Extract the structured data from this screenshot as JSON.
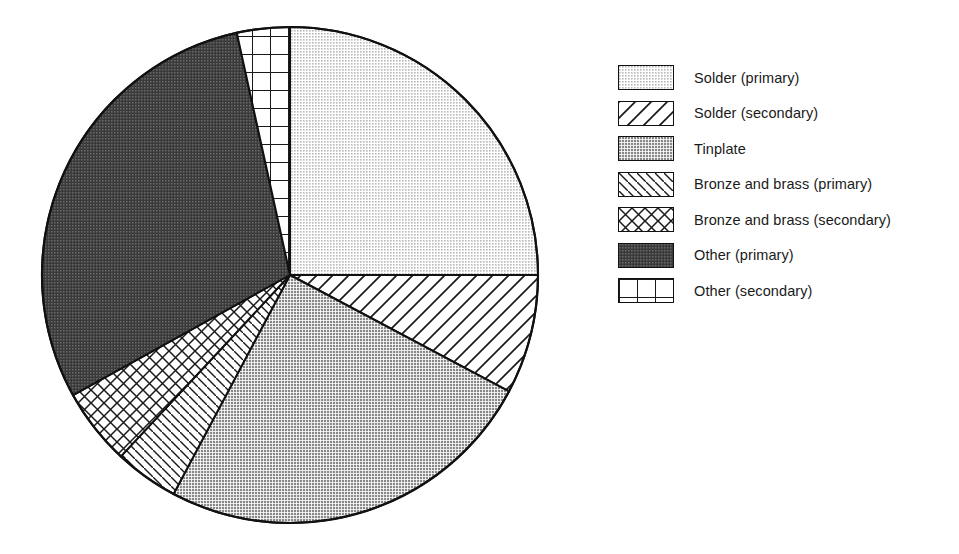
{
  "chart_data": {
    "type": "pie",
    "title": "",
    "subtitle": "",
    "xlabel": "",
    "ylabel": "",
    "legend_position": "right",
    "grid": false,
    "start_angle_deg": 0,
    "direction": "clockwise",
    "categories": [
      "Solder (primary)",
      "Solder (secondary)",
      "Tinplate",
      "Bronze and brass (primary)",
      "Bronze and brass (secondary)",
      "Other (primary)",
      "Other (secondary)"
    ],
    "values": [
      25.0,
      7.8,
      25.0,
      4.2,
      5.0,
      29.7,
      3.3
    ],
    "units": "percent",
    "slices": [
      {
        "label": "Solder (primary)",
        "value": 25.0,
        "start_deg": 0,
        "end_deg": 90,
        "pattern": "fine-stipple-light",
        "fill": "#d9d9d9"
      },
      {
        "label": "Solder (secondary)",
        "value": 7.8,
        "start_deg": 90,
        "end_deg": 118,
        "pattern": "diagonal-hatch-backslash-wide",
        "fill": "#ffffff"
      },
      {
        "label": "Tinplate",
        "value": 25.0,
        "start_deg": 118,
        "end_deg": 208,
        "pattern": "stipple-medium",
        "fill": "#a8a8a8"
      },
      {
        "label": "Bronze and brass (primary)",
        "value": 4.2,
        "start_deg": 208,
        "end_deg": 223,
        "pattern": "diagonal-hatch-slash-narrow",
        "fill": "#ffffff"
      },
      {
        "label": "Bronze and brass (secondary)",
        "value": 5.0,
        "start_deg": 223,
        "end_deg": 241,
        "pattern": "cross-hatch-diagonal",
        "fill": "#ffffff"
      },
      {
        "label": "Other (primary)",
        "value": 29.7,
        "start_deg": 241,
        "end_deg": 347.6,
        "pattern": "stipple-dark",
        "fill": "#4d4d4d"
      },
      {
        "label": "Other (secondary)",
        "value": 3.3,
        "start_deg": 347.6,
        "end_deg": 360,
        "pattern": "grid-square",
        "fill": "#ffffff"
      }
    ],
    "geometry": {
      "center_x": 290,
      "center_y": 275,
      "radius": 248
    }
  },
  "legend": {
    "items": [
      {
        "label": "Solder (primary)",
        "pattern": "fine-stipple-light",
        "swatch_name": "swatch-solder-primary"
      },
      {
        "label": "Solder (secondary)",
        "pattern": "diagonal-hatch-backslash-wide",
        "swatch_name": "swatch-solder-secondary"
      },
      {
        "label": "Tinplate",
        "pattern": "stipple-medium",
        "swatch_name": "swatch-tinplate"
      },
      {
        "label": "Bronze and brass (primary)",
        "pattern": "diagonal-hatch-slash-narrow",
        "swatch_name": "swatch-bronze-primary"
      },
      {
        "label": "Bronze and brass (secondary)",
        "pattern": "cross-hatch-diagonal",
        "swatch_name": "swatch-bronze-secondary"
      },
      {
        "label": "Other (primary)",
        "pattern": "stipple-dark",
        "swatch_name": "swatch-other-primary"
      },
      {
        "label": "Other (secondary)",
        "pattern": "grid-square",
        "swatch_name": "swatch-other-secondary"
      }
    ]
  },
  "colors": {
    "outline": "#111111",
    "text": "#1a1a1a",
    "background": "#ffffff",
    "light_gray": "#d9d9d9",
    "medium_gray": "#a8a8a8",
    "dark_gray": "#4d4d4d"
  }
}
